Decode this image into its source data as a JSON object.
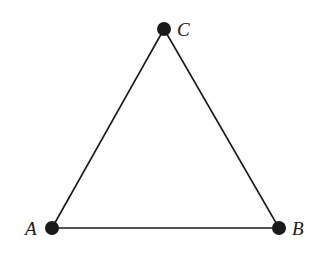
{
  "diagram": {
    "type": "triangle-graph",
    "stroke_color": "#1a1a1a",
    "vertices": [
      {
        "id": "A",
        "label": "A",
        "x": 52,
        "y": 228
      },
      {
        "id": "B",
        "label": "B",
        "x": 279,
        "y": 228
      },
      {
        "id": "C",
        "label": "C",
        "x": 164,
        "y": 29
      }
    ],
    "edges": [
      {
        "from": "A",
        "to": "B"
      },
      {
        "from": "B",
        "to": "C"
      },
      {
        "from": "C",
        "to": "A"
      }
    ]
  }
}
